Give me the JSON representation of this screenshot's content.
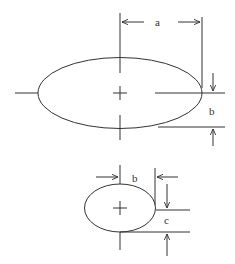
{
  "diagram": {
    "stroke_color": "#333333",
    "background": "#ffffff",
    "large_ellipse": {
      "label_width": "a",
      "label_height": "b"
    },
    "small_ellipse": {
      "label_width": "b",
      "label_height": "c"
    }
  }
}
